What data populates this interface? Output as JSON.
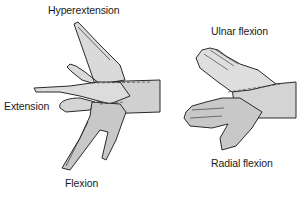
{
  "figure": {
    "left_diagram": {
      "title": "Wrist extension and flexion",
      "labels": {
        "hyperextension": "Hyperextension",
        "extension": "Extension",
        "flexion": "Flexion"
      }
    },
    "right_diagram": {
      "title": "Wrist ulnar and radial flexion",
      "labels": {
        "ulnar_flexion": "Ulnar flexion",
        "radial_flexion": "Radial flexion"
      }
    }
  },
  "colors": {
    "hand_fill": "#d6d6d6",
    "hand_fill_dark": "#bdbdbd",
    "outline": "#2a2a2a",
    "background": "#ffffff"
  }
}
